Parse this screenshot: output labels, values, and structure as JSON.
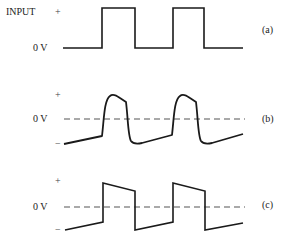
{
  "panels": [
    {
      "id": "a",
      "tag": "(a)",
      "title": "INPUT",
      "plus": "+",
      "zero": "0 V",
      "minus": "",
      "description": "Square-wave input pulses"
    },
    {
      "id": "b",
      "tag": "(b)",
      "title": "",
      "plus": "+",
      "zero": "0 V",
      "minus": "−",
      "description": "Distorted output with rounded rise and tilt"
    },
    {
      "id": "c",
      "tag": "(c)",
      "title": "",
      "plus": "+",
      "zero": "0 V",
      "minus": "−",
      "description": "Output with tilt (sag) from low-frequency coupling"
    }
  ],
  "colors": {
    "trace": "#1a1a1a",
    "dashed_zero": "#555555"
  },
  "geometry": {
    "a": "M63,48 L102,48 L102,8 L135,8 L135,48 L173,48 L173,8 L204,8 L204,48 L243,48",
    "b": "M64,144 L102,136 C104,120 104,100 110,96 C112,94 116,95 120,98 L126,102 C128,118 128,136 131,141 C133,144 137,144 142,143 L172,135 C174,118 174,100 180,96 C182,94 186,95 190,98 L196,102 C198,118 198,136 201,141 C203,144 207,144 212,143 L243,134",
    "c": "M65,230 L103,222 L103,183 L135,191 L135,230 L173,222 L173,183 L205,191 L205,230 L243,223",
    "zero_b_y": 119,
    "zero_c_y": 207
  }
}
